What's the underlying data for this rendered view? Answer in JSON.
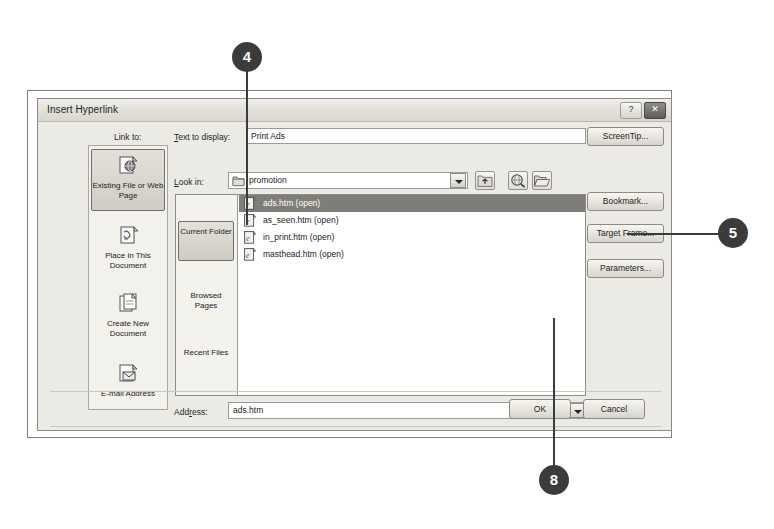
{
  "dialog": {
    "title": "Insert Hyperlink",
    "titlebar_buttons": [
      {
        "name": "help-button",
        "glyph": "?"
      },
      {
        "name": "close-button",
        "glyph": "✕"
      }
    ],
    "link_to_label": "Link to:",
    "sidebar": {
      "items": [
        {
          "label": "Existing File or Web Page",
          "icon": "existing-file-web-page-icon",
          "selected": true
        },
        {
          "label": "Place in This Document",
          "icon": "place-in-document-icon",
          "selected": false
        },
        {
          "label": "Create New Document",
          "icon": "create-new-document-icon",
          "selected": false
        },
        {
          "label": "E-mail Address",
          "icon": "email-address-icon",
          "selected": false
        }
      ]
    },
    "text_to_display": {
      "label": "Text to display:",
      "value": "Print Ads"
    },
    "look_in": {
      "label": "Look in:",
      "value": "promotion",
      "folder_icon": "folder-icon",
      "dropdown_icon": "chevron-down-icon",
      "tool_buttons": [
        {
          "name": "up-one-folder-button",
          "icon": "up-folder-icon"
        },
        {
          "name": "browse-the-web-button",
          "icon": "globe-search-icon"
        },
        {
          "name": "browse-for-file-button",
          "icon": "open-folder-icon"
        }
      ]
    },
    "place_nav": [
      {
        "label": "Current Folder",
        "selected": true
      },
      {
        "label": "Browsed Pages",
        "selected": false
      },
      {
        "label": "Recent Files",
        "selected": false
      }
    ],
    "file_list": [
      {
        "name": "ads.htm (open)",
        "icon": "html-page-icon",
        "selected": true
      },
      {
        "name": "as_seen.htm (open)",
        "icon": "html-page-icon",
        "selected": false
      },
      {
        "name": "in_print.htm (open)",
        "icon": "html-page-icon",
        "selected": false
      },
      {
        "name": "masthead.htm (open)",
        "icon": "html-page-icon",
        "selected": false
      }
    ],
    "address": {
      "label": "Address:",
      "value": "ads.htm",
      "dropdown_icon": "chevron-down-icon"
    },
    "side_buttons": [
      {
        "name": "screentip-button",
        "label": "ScreenTip..."
      },
      {
        "name": "bookmark-button",
        "label": "Bookmark..."
      },
      {
        "name": "target-frame-button",
        "label": "Target Frame..."
      },
      {
        "name": "parameters-button",
        "label": "Parameters..."
      }
    ],
    "footer_buttons": {
      "ok": "OK",
      "cancel": "Cancel"
    }
  },
  "callouts": [
    {
      "number": "4",
      "target": "selected-file-row"
    },
    {
      "number": "5",
      "target": "target-frame-button"
    },
    {
      "number": "8",
      "target": "ok-button"
    }
  ],
  "colors": {
    "callout_fill": "#3b3b3b",
    "selection_fill": "#7f7d78",
    "dialog_face": "#eceae4"
  }
}
